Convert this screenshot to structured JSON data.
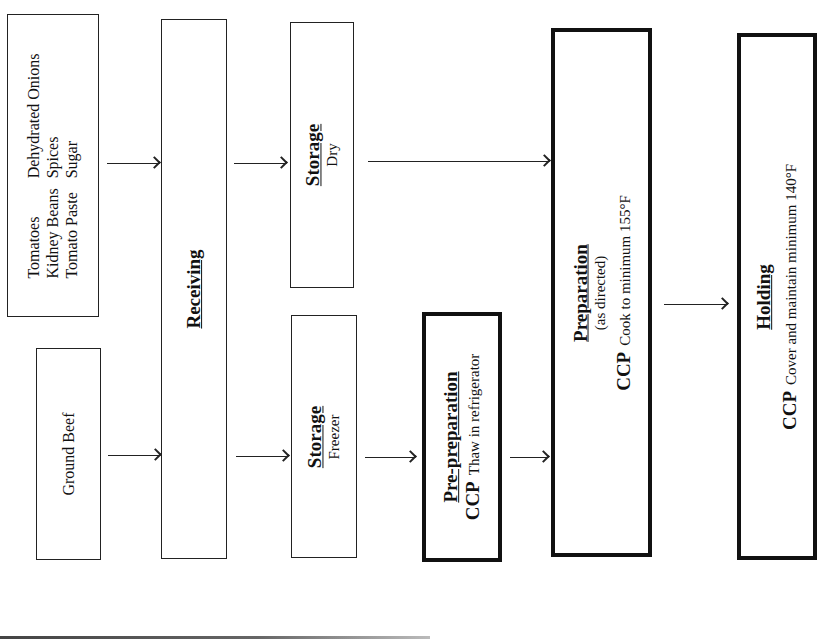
{
  "diagram": {
    "type": "HACCP food process flowchart",
    "orientation": "rotated 90deg counter-clockwise",
    "nodes": {
      "ingredients": {
        "col1": [
          "Tomatoes",
          "Kidney Beans",
          "Tomato Paste"
        ],
        "col2": [
          "Dehydrated Onions",
          "Spices",
          "Sugar"
        ]
      },
      "ground_beef": {
        "label": "Ground Beef"
      },
      "receiving": {
        "title": "Receiving"
      },
      "storage_dry": {
        "title": "Storage",
        "subtitle": "Dry"
      },
      "storage_freezer": {
        "title": "Storage",
        "subtitle": "Freezer"
      },
      "pre_preparation": {
        "title": "Pre-preparation",
        "ccp": "CCP",
        "ccp_text": "Thaw in refrigerator"
      },
      "preparation": {
        "title": "Preparation",
        "subtitle": "(as directed)",
        "ccp": "CCP",
        "ccp_text": "Cook to minimum 155°F"
      },
      "holding": {
        "title": "Holding",
        "ccp": "CCP",
        "ccp_text": "Cover and maintain minimum 140°F"
      }
    },
    "edges": [
      {
        "from": "ingredients",
        "to": "receiving"
      },
      {
        "from": "ground_beef",
        "to": "receiving"
      },
      {
        "from": "receiving",
        "to": "storage_dry"
      },
      {
        "from": "receiving",
        "to": "storage_freezer"
      },
      {
        "from": "storage_dry",
        "to": "preparation"
      },
      {
        "from": "storage_freezer",
        "to": "pre_preparation"
      },
      {
        "from": "pre_preparation",
        "to": "preparation"
      },
      {
        "from": "preparation",
        "to": "holding"
      }
    ]
  }
}
